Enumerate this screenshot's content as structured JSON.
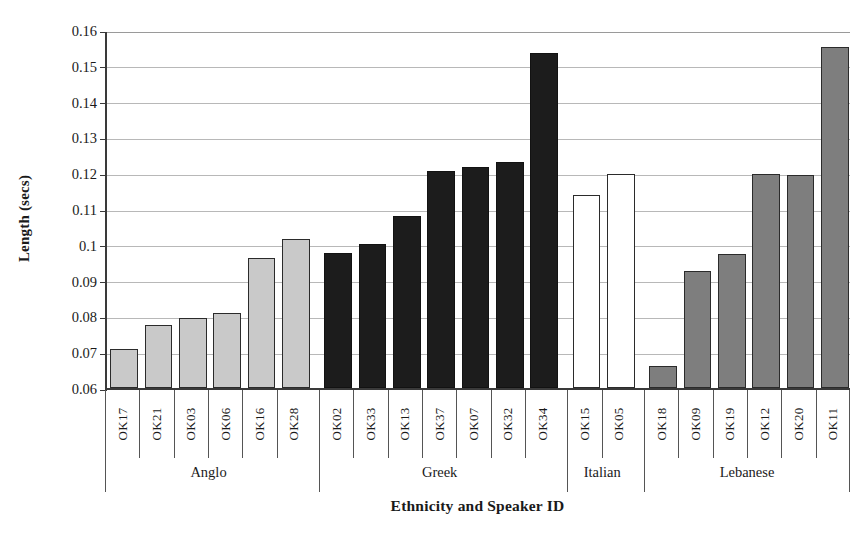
{
  "chart_data": {
    "type": "bar",
    "title": "",
    "xlabel": "Ethnicity and Speaker ID",
    "ylabel": "Length (secs)",
    "ylim": [
      0.06,
      0.16
    ],
    "ytick_labels": [
      "0.16",
      "0.15",
      "0.14",
      "0.13",
      "0.12",
      "0.11",
      "0.1",
      "0.09",
      "0.08",
      "0.07",
      "0.06"
    ],
    "ytick_values": [
      0.16,
      0.15,
      0.14,
      0.13,
      0.12,
      0.11,
      0.1,
      0.09,
      0.08,
      0.07,
      0.06
    ],
    "grid": true,
    "legend": "none",
    "categories": [
      "OK17",
      "OK21",
      "OK03",
      "OK06",
      "OK16",
      "OK28",
      "OK02",
      "OK33",
      "OK13",
      "OK37",
      "OK07",
      "OK32",
      "OK34",
      "OK15",
      "OK05",
      "OK18",
      "OK09",
      "OK19",
      "OK12",
      "OK20",
      "OK11"
    ],
    "values": [
      0.071,
      0.0775,
      0.0795,
      0.081,
      0.0962,
      0.1015,
      0.0977,
      0.1003,
      0.108,
      0.1205,
      0.1218,
      0.1232,
      0.1537,
      0.114,
      0.1198,
      0.0662,
      0.0927,
      0.0973,
      0.1197,
      0.1196,
      0.1553
    ],
    "groups": [
      {
        "name": "Anglo",
        "fill": "light",
        "color": "#c9c9c9",
        "speakers": [
          {
            "id": "OK17",
            "value": 0.071
          },
          {
            "id": "OK21",
            "value": 0.0775
          },
          {
            "id": "OK03",
            "value": 0.0795
          },
          {
            "id": "OK06",
            "value": 0.081
          },
          {
            "id": "OK16",
            "value": 0.0962
          },
          {
            "id": "OK28",
            "value": 0.1015
          }
        ]
      },
      {
        "name": "Greek",
        "fill": "dark",
        "color": "#1c1c1c",
        "speakers": [
          {
            "id": "OK02",
            "value": 0.0977
          },
          {
            "id": "OK33",
            "value": 0.1003
          },
          {
            "id": "OK13",
            "value": 0.108
          },
          {
            "id": "OK37",
            "value": 0.1205
          },
          {
            "id": "OK07",
            "value": 0.1218
          },
          {
            "id": "OK32",
            "value": 0.1232
          },
          {
            "id": "OK34",
            "value": 0.1537
          }
        ]
      },
      {
        "name": "Italian",
        "fill": "white",
        "color": "#ffffff",
        "speakers": [
          {
            "id": "OK15",
            "value": 0.114
          },
          {
            "id": "OK05",
            "value": 0.1198
          }
        ]
      },
      {
        "name": "Lebanese",
        "fill": "medium",
        "color": "#7e7e7e",
        "speakers": [
          {
            "id": "OK18",
            "value": 0.0662
          },
          {
            "id": "OK09",
            "value": 0.0927
          },
          {
            "id": "OK19",
            "value": 0.0973
          },
          {
            "id": "OK12",
            "value": 0.1197
          },
          {
            "id": "OK20",
            "value": 0.1196
          },
          {
            "id": "OK11",
            "value": 0.1553
          }
        ]
      }
    ]
  }
}
